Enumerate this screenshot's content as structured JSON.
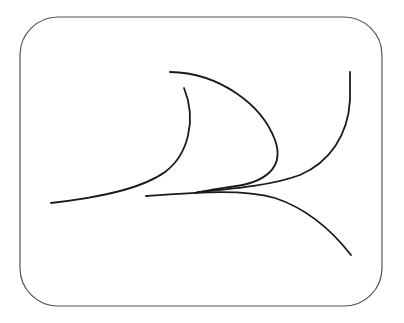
{
  "figure": {
    "width": 404,
    "height": 323,
    "background": "#ffffff",
    "frame": {
      "shape": "rounded-rectangle",
      "x": 20,
      "y": 17,
      "width": 362,
      "height": 289,
      "corner_radius": 38,
      "stroke": "#555555"
    },
    "curves": [
      {
        "name": "left-sweep-curve",
        "stroke": "#1a1a1a",
        "path": "M51,203 C95,198 140,190 165,172 C188,155 197,120 184,88"
      },
      {
        "name": "upper-arc-curve",
        "stroke": "#1a1a1a",
        "path": "M170,72 C220,73 262,105 275,140 C285,168 265,183 230,187 C215,189 205,191 195,193"
      },
      {
        "name": "right-tall-curve",
        "stroke": "#1a1a1a",
        "path": "M350,72 L350,100 C348,135 330,162 300,175 C270,186 230,189 198,192"
      },
      {
        "name": "lower-branch-curve",
        "stroke": "#1a1a1a",
        "path": "M146,196 C190,193 240,188 275,198 C305,208 330,228 351,255"
      }
    ]
  }
}
